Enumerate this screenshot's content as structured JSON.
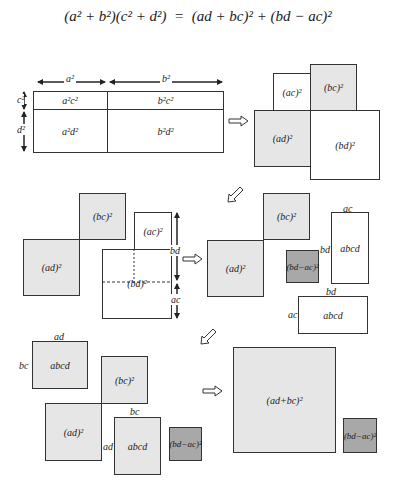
{
  "formula": {
    "lhs": "(a² + b²)(c² + d²)",
    "eq": "=",
    "rhs": "(ad + bc)² + (bd − ac)²"
  },
  "step1": {
    "width_labels": [
      "a²",
      "b²"
    ],
    "height_labels": [
      "c²",
      "d²"
    ],
    "cells": [
      "a²c²",
      "b²c²",
      "a²d²",
      "b²d²"
    ]
  },
  "step2": {
    "squares": [
      "(ac)²",
      "(bc)²",
      "(ad)²",
      "(bd)²"
    ]
  },
  "step3": {
    "squares": [
      "(bc)²",
      "(ad)²",
      "(ac)²",
      "(bd)²"
    ],
    "side_labels": [
      "bd",
      "ac"
    ]
  },
  "step4": {
    "squares": [
      "(bc)²",
      "(ad)²",
      "(bd−ac)²"
    ],
    "rects": [
      {
        "label": "abcd",
        "top": "ac",
        "side": "bd"
      },
      {
        "label": "abcd",
        "top": "bd",
        "side": "ac"
      }
    ]
  },
  "step5": {
    "rect_top": {
      "label": "abcd",
      "top": "ad",
      "side": "bc"
    },
    "squares": [
      "(bc)²",
      "(ad)²",
      "(bd−ac)²"
    ],
    "rect_bottom": {
      "label": "abcd",
      "top": "bc",
      "side": "ad"
    }
  },
  "step6": {
    "squares": [
      "(ad+bc)²",
      "(bd−ac)²"
    ]
  },
  "arrows": [
    "right",
    "down-left",
    "right",
    "down-left",
    "right"
  ],
  "colors": {
    "light_fill": "#e6e6e6",
    "dark_fill": "#a8a8a8",
    "stroke": "#333333"
  }
}
